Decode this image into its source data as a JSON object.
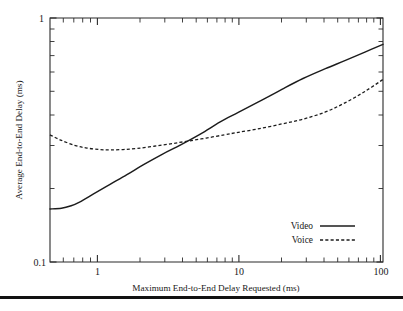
{
  "chart_data": {
    "type": "line",
    "title": "",
    "xlabel": "Maximum End-to-End Delay Requested (ms)",
    "ylabel": "Average End-to-End Delay (ms)",
    "xscale": "log",
    "yscale": "log",
    "xlim": [
      0.5,
      100
    ],
    "ylim": [
      0.1,
      1
    ],
    "grid": false,
    "legend_position": "lower-right",
    "xtick_labels": [
      "1",
      "10",
      "100"
    ],
    "xtick_values": [
      1,
      10,
      100
    ],
    "ytick_labels": [
      "0.1",
      "1"
    ],
    "ytick_values": [
      0.1,
      1
    ],
    "series": [
      {
        "name": "Video",
        "style": "solid",
        "x": [
          0.5,
          0.6,
          0.7,
          0.8,
          1.0,
          1.3,
          1.7,
          2.2,
          3.0,
          4.0,
          5.5,
          7.5,
          10,
          14,
          20,
          28,
          40,
          55,
          75,
          100
        ],
        "values": [
          0.165,
          0.166,
          0.17,
          0.176,
          0.19,
          0.208,
          0.228,
          0.25,
          0.277,
          0.302,
          0.335,
          0.375,
          0.41,
          0.455,
          0.51,
          0.565,
          0.62,
          0.67,
          0.725,
          0.78
        ]
      },
      {
        "name": "Voice",
        "style": "dashed",
        "x": [
          0.5,
          0.6,
          0.75,
          0.9,
          1.1,
          1.3,
          1.6,
          2.0,
          2.6,
          3.4,
          4.5,
          6.0,
          8.0,
          10,
          14,
          20,
          28,
          40,
          55,
          75,
          100
        ],
        "values": [
          0.332,
          0.315,
          0.3,
          0.293,
          0.289,
          0.288,
          0.289,
          0.292,
          0.298,
          0.305,
          0.313,
          0.322,
          0.332,
          0.34,
          0.352,
          0.368,
          0.385,
          0.412,
          0.45,
          0.5,
          0.56
        ]
      }
    ]
  },
  "axes": {
    "x_axis_title": "Maximum End-to-End Delay Requested (ms)",
    "y_axis_title": "Average End-to-End Delay (ms)",
    "x_ticks": [
      {
        "label": "1",
        "value": 1
      },
      {
        "label": "10",
        "value": 10
      },
      {
        "label": "100",
        "value": 100
      }
    ],
    "y_ticks": [
      {
        "label": "1",
        "value": 1
      },
      {
        "label": "0.1",
        "value": 0.1
      }
    ]
  },
  "legend": {
    "entries": [
      {
        "label": "Video",
        "style": "solid"
      },
      {
        "label": "Voice",
        "style": "dashed"
      }
    ]
  },
  "colors": {
    "line": "#1c1c1c",
    "frame": "#2b2b2b",
    "background": "#ffffff",
    "rule": "#111111"
  }
}
